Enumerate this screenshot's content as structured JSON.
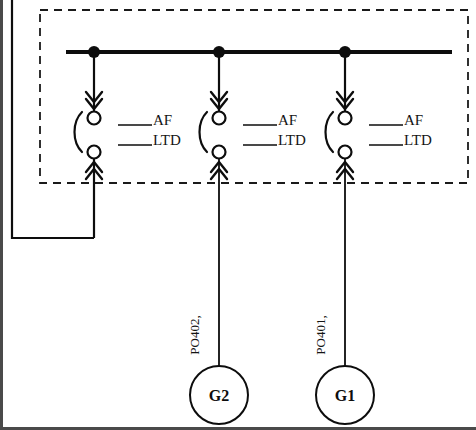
{
  "diagram": {
    "enclosure": {
      "name": "switchgear-enclosure",
      "style": "dashed"
    },
    "bus": {
      "name": "main-bus",
      "node_count": 3
    },
    "breakers": [
      {
        "id": "breaker-1",
        "af_label": "AF",
        "ltd_label": "LTD",
        "af_value": "",
        "ltd_value": "",
        "x": 94
      },
      {
        "id": "breaker-2",
        "af_label": "AF",
        "ltd_label": "LTD",
        "af_value": "",
        "ltd_value": "",
        "x": 219
      },
      {
        "id": "breaker-3",
        "af_label": "AF",
        "ltd_label": "LTD",
        "af_value": "",
        "ltd_value": "",
        "x": 345
      }
    ],
    "generators": [
      {
        "id": "generator-g2",
        "label": "G2",
        "cable_label": "PO402,",
        "x": 219
      },
      {
        "id": "generator-g1",
        "label": "G1",
        "cable_label": "PO401,",
        "x": 345
      }
    ],
    "feeder": {
      "name": "left-feeder",
      "label": ""
    },
    "colors": {
      "line": "#0d0d0d",
      "dash": "#1a1a1a",
      "background": "#ffffff",
      "border": "#3a3a3a"
    }
  }
}
